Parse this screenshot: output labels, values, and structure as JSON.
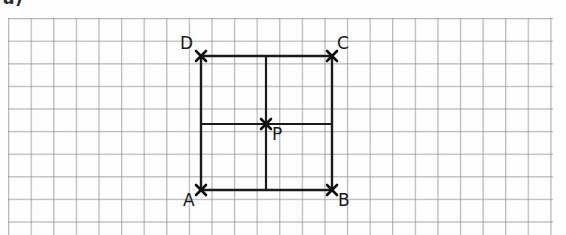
{
  "worksheet": {
    "item_label": "a)"
  },
  "grid": {
    "cell_size_px": 22.6,
    "line_color": "#787c88",
    "origin_x_px": 8,
    "origin_y_px": 18,
    "width_px": 545,
    "height_px": 217,
    "columns": 24,
    "rows": 9
  },
  "figure": {
    "type": "square-with-medians",
    "stroke_color": "#1b1b1b",
    "square": {
      "left_px": 201,
      "top_px": 56,
      "right_px": 332,
      "bottom_px": 190,
      "width_px": 131,
      "height_px": 134,
      "side_cells": 6
    },
    "interior_lines": [
      {
        "name": "vertical-median",
        "orientation": "vertical",
        "x_px": 266,
        "y1_px": 56,
        "y2_px": 190
      },
      {
        "name": "horizontal-median",
        "orientation": "horizontal",
        "y_px": 124,
        "x1_px": 201,
        "x2_px": 332
      }
    ],
    "points": [
      {
        "id": "D",
        "label": "D",
        "x_px": 201,
        "y_px": 56,
        "label_x_px": 180,
        "label_y_px": 35,
        "marker": "cross"
      },
      {
        "id": "C",
        "label": "C",
        "x_px": 332,
        "y_px": 56,
        "label_x_px": 337,
        "label_y_px": 35,
        "marker": "cross"
      },
      {
        "id": "P",
        "label": "P",
        "x_px": 266,
        "y_px": 124,
        "label_x_px": 272,
        "label_y_px": 126,
        "marker": "cross"
      },
      {
        "id": "A",
        "label": "A",
        "x_px": 201,
        "y_px": 190,
        "label_x_px": 183,
        "label_y_px": 192,
        "marker": "cross"
      },
      {
        "id": "B",
        "label": "B",
        "x_px": 332,
        "y_px": 190,
        "label_x_px": 338,
        "label_y_px": 192,
        "marker": "cross"
      }
    ]
  }
}
